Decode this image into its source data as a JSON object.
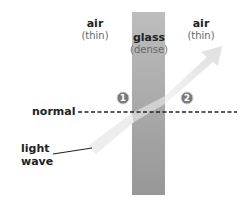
{
  "diagram": {
    "regions": [
      {
        "name": "air",
        "subtitle": "(thin)"
      },
      {
        "name": "glass",
        "subtitle": "(dense)"
      },
      {
        "name": "air",
        "subtitle": "(thin)"
      }
    ],
    "labels": {
      "normal": "normal",
      "light_wave_line1": "light",
      "light_wave_line2": "wave"
    },
    "markers": [
      "1",
      "2"
    ],
    "colors": {
      "glass_top": "#bdbdbd",
      "glass_bottom": "#9a9a9a",
      "beam": "#e6e6e6",
      "marker_fill": "#7a7a7a",
      "normal_line": "#222222"
    }
  }
}
